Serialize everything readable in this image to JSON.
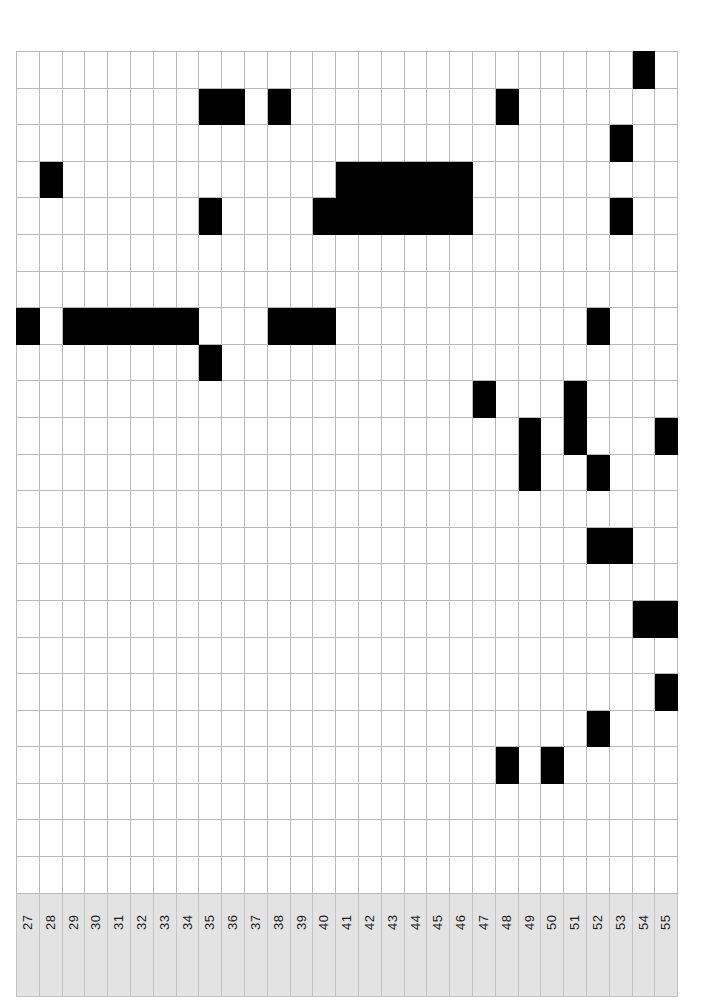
{
  "figure": {
    "name": "presence-absence-matrix",
    "background_color": "#ffffff",
    "grid_line_color": "#b9b9b9",
    "filled_cell_color": "#000000",
    "empty_cell_color": "#ffffff",
    "header_background_color": "#e3e3e3",
    "header_text_color": "#1a1a1a"
  },
  "grid": {
    "column_count": 29,
    "row_count": 23,
    "cell_width_px": 22.8,
    "cell_height_px": 36.6,
    "origin_x_px": 16,
    "origin_y_px": 51
  },
  "columns": {
    "headers": [
      "27",
      "28",
      "29",
      "30",
      "31",
      "32",
      "33",
      "34",
      "35",
      "36",
      "37",
      "38",
      "39",
      "40",
      "41",
      "42",
      "43",
      "44",
      "45",
      "46",
      "47",
      "48",
      "49",
      "50",
      "51",
      "52",
      "53",
      "54",
      "55"
    ],
    "orientation": "vertical"
  },
  "chart_data": {
    "type": "heatmap",
    "title": "",
    "xlabel": "",
    "ylabel": "",
    "categories": [
      "27",
      "28",
      "29",
      "30",
      "31",
      "32",
      "33",
      "34",
      "35",
      "36",
      "37",
      "38",
      "39",
      "40",
      "41",
      "42",
      "43",
      "44",
      "45",
      "46",
      "47",
      "48",
      "49",
      "50",
      "51",
      "52",
      "53",
      "54",
      "55"
    ],
    "rows": [
      {
        "index": 1,
        "values": [
          0,
          0,
          0,
          0,
          0,
          0,
          0,
          0,
          0,
          0,
          0,
          0,
          0,
          0,
          0,
          0,
          0,
          0,
          0,
          0,
          0,
          0,
          0,
          0,
          0,
          0,
          0,
          1,
          0
        ]
      },
      {
        "index": 2,
        "values": [
          0,
          0,
          0,
          0,
          0,
          0,
          0,
          0,
          1,
          1,
          0,
          1,
          0,
          0,
          0,
          0,
          0,
          0,
          0,
          0,
          0,
          1,
          0,
          0,
          0,
          0,
          0,
          0,
          0
        ]
      },
      {
        "index": 3,
        "values": [
          0,
          0,
          0,
          0,
          0,
          0,
          0,
          0,
          0,
          0,
          0,
          0,
          0,
          0,
          0,
          0,
          0,
          0,
          0,
          0,
          0,
          0,
          0,
          0,
          0,
          0,
          1,
          0,
          0
        ]
      },
      {
        "index": 4,
        "values": [
          0,
          1,
          0,
          0,
          0,
          0,
          0,
          0,
          0,
          0,
          0,
          0,
          0,
          0,
          1,
          1,
          1,
          1,
          1,
          1,
          0,
          0,
          0,
          0,
          0,
          0,
          0,
          0,
          0
        ]
      },
      {
        "index": 5,
        "values": [
          0,
          0,
          0,
          0,
          0,
          0,
          0,
          0,
          1,
          0,
          0,
          0,
          0,
          1,
          1,
          1,
          1,
          1,
          1,
          1,
          0,
          0,
          0,
          0,
          0,
          0,
          1,
          0,
          0
        ]
      },
      {
        "index": 6,
        "values": [
          0,
          0,
          0,
          0,
          0,
          0,
          0,
          0,
          0,
          0,
          0,
          0,
          0,
          0,
          0,
          0,
          0,
          0,
          0,
          0,
          0,
          0,
          0,
          0,
          0,
          0,
          0,
          0,
          0
        ]
      },
      {
        "index": 7,
        "values": [
          0,
          0,
          0,
          0,
          0,
          0,
          0,
          0,
          0,
          0,
          0,
          0,
          0,
          0,
          0,
          0,
          0,
          0,
          0,
          0,
          0,
          0,
          0,
          0,
          0,
          0,
          0,
          0,
          0
        ]
      },
      {
        "index": 8,
        "values": [
          1,
          0,
          1,
          1,
          1,
          1,
          1,
          1,
          0,
          0,
          0,
          1,
          1,
          1,
          0,
          0,
          0,
          0,
          0,
          0,
          0,
          0,
          0,
          0,
          0,
          1,
          0,
          0,
          0
        ]
      },
      {
        "index": 9,
        "values": [
          0,
          0,
          0,
          0,
          0,
          0,
          0,
          0,
          1,
          0,
          0,
          0,
          0,
          0,
          0,
          0,
          0,
          0,
          0,
          0,
          0,
          0,
          0,
          0,
          0,
          0,
          0,
          0,
          0
        ]
      },
      {
        "index": 10,
        "values": [
          0,
          0,
          0,
          0,
          0,
          0,
          0,
          0,
          0,
          0,
          0,
          0,
          0,
          0,
          0,
          0,
          0,
          0,
          0,
          0,
          1,
          0,
          0,
          0,
          1,
          0,
          0,
          0,
          0
        ]
      },
      {
        "index": 11,
        "values": [
          0,
          0,
          0,
          0,
          0,
          0,
          0,
          0,
          0,
          0,
          0,
          0,
          0,
          0,
          0,
          0,
          0,
          0,
          0,
          0,
          0,
          0,
          1,
          0,
          1,
          0,
          0,
          0,
          1
        ]
      },
      {
        "index": 12,
        "values": [
          0,
          0,
          0,
          0,
          0,
          0,
          0,
          0,
          0,
          0,
          0,
          0,
          0,
          0,
          0,
          0,
          0,
          0,
          0,
          0,
          0,
          0,
          1,
          0,
          0,
          1,
          0,
          0,
          0
        ]
      },
      {
        "index": 13,
        "values": [
          0,
          0,
          0,
          0,
          0,
          0,
          0,
          0,
          0,
          0,
          0,
          0,
          0,
          0,
          0,
          0,
          0,
          0,
          0,
          0,
          0,
          0,
          0,
          0,
          0,
          0,
          0,
          0,
          0
        ]
      },
      {
        "index": 14,
        "values": [
          0,
          0,
          0,
          0,
          0,
          0,
          0,
          0,
          0,
          0,
          0,
          0,
          0,
          0,
          0,
          0,
          0,
          0,
          0,
          0,
          0,
          0,
          0,
          0,
          0,
          1,
          1,
          0,
          0
        ]
      },
      {
        "index": 15,
        "values": [
          0,
          0,
          0,
          0,
          0,
          0,
          0,
          0,
          0,
          0,
          0,
          0,
          0,
          0,
          0,
          0,
          0,
          0,
          0,
          0,
          0,
          0,
          0,
          0,
          0,
          0,
          0,
          0,
          0
        ]
      },
      {
        "index": 16,
        "values": [
          0,
          0,
          0,
          0,
          0,
          0,
          0,
          0,
          0,
          0,
          0,
          0,
          0,
          0,
          0,
          0,
          0,
          0,
          0,
          0,
          0,
          0,
          0,
          0,
          0,
          0,
          0,
          1,
          1
        ]
      },
      {
        "index": 17,
        "values": [
          0,
          0,
          0,
          0,
          0,
          0,
          0,
          0,
          0,
          0,
          0,
          0,
          0,
          0,
          0,
          0,
          0,
          0,
          0,
          0,
          0,
          0,
          0,
          0,
          0,
          0,
          0,
          0,
          0
        ]
      },
      {
        "index": 18,
        "values": [
          0,
          0,
          0,
          0,
          0,
          0,
          0,
          0,
          0,
          0,
          0,
          0,
          0,
          0,
          0,
          0,
          0,
          0,
          0,
          0,
          0,
          0,
          0,
          0,
          0,
          0,
          0,
          0,
          1
        ]
      },
      {
        "index": 19,
        "values": [
          0,
          0,
          0,
          0,
          0,
          0,
          0,
          0,
          0,
          0,
          0,
          0,
          0,
          0,
          0,
          0,
          0,
          0,
          0,
          0,
          0,
          0,
          0,
          0,
          0,
          1,
          0,
          0,
          0
        ]
      },
      {
        "index": 20,
        "values": [
          0,
          0,
          0,
          0,
          0,
          0,
          0,
          0,
          0,
          0,
          0,
          0,
          0,
          0,
          0,
          0,
          0,
          0,
          0,
          0,
          0,
          1,
          0,
          1,
          0,
          0,
          0,
          0,
          0
        ]
      },
      {
        "index": 21,
        "values": [
          0,
          0,
          0,
          0,
          0,
          0,
          0,
          0,
          0,
          0,
          0,
          0,
          0,
          0,
          0,
          0,
          0,
          0,
          0,
          0,
          0,
          0,
          0,
          0,
          0,
          0,
          0,
          0,
          0
        ]
      },
      {
        "index": 22,
        "values": [
          0,
          0,
          0,
          0,
          0,
          0,
          0,
          0,
          0,
          0,
          0,
          0,
          0,
          0,
          0,
          0,
          0,
          0,
          0,
          0,
          0,
          0,
          0,
          0,
          0,
          0,
          0,
          0,
          0
        ]
      },
      {
        "index": 23,
        "values": [
          0,
          0,
          0,
          0,
          0,
          0,
          0,
          0,
          0,
          0,
          0,
          0,
          0,
          0,
          0,
          0,
          0,
          0,
          0,
          0,
          0,
          0,
          0,
          0,
          0,
          0,
          0,
          0,
          0
        ]
      }
    ],
    "legend": [],
    "grid": true
  }
}
